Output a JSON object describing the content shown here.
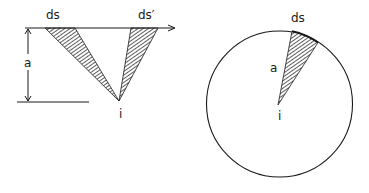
{
  "figure": {
    "left_panel": {
      "labels": {
        "ds": "ds",
        "ds_prime": "ds′",
        "a": "a",
        "i": "i"
      },
      "description": "Point i at distance a below a straight line; two hatched wedges subtending ds and ds' on the line"
    },
    "right_panel": {
      "labels": {
        "ds": "ds",
        "a": "a",
        "i": "i"
      },
      "description": "Point i at the centre of a circle of radius a; hatched wedge subtending arc ds"
    },
    "colors": {
      "stroke": "#1a1a1a",
      "background": "#ffffff"
    }
  }
}
